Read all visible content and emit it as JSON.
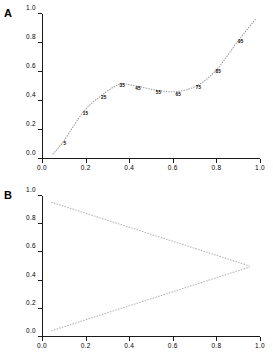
{
  "figure": {
    "panels": [
      {
        "label": "A",
        "name": "panel-a"
      },
      {
        "label": "B",
        "name": "panel-b"
      }
    ]
  },
  "axes": {
    "x_ticks": [
      "0.0",
      "0.2",
      "0.4",
      "0.6",
      "0.8",
      "1.0"
    ],
    "x_tick_values": [
      0.0,
      0.2,
      0.4,
      0.6,
      0.8,
      1.0
    ],
    "y_ticks": [
      "0.0",
      "0.2",
      "0.4",
      "0.6",
      "0.8",
      "1.0"
    ],
    "y_tick_values": [
      0.0,
      0.2,
      0.4,
      0.6,
      0.8,
      1.0
    ]
  },
  "chart_data": [
    {
      "type": "line",
      "panel": "A",
      "title": "",
      "xlabel": "",
      "ylabel": "",
      "xlim": [
        0.0,
        1.0
      ],
      "ylim": [
        0.0,
        1.0
      ],
      "grid": false,
      "legend": "none",
      "linestyle": "dotted",
      "color": "#9a9a9a",
      "x": [
        0.05,
        0.1,
        0.19,
        0.27,
        0.355,
        0.425,
        0.525,
        0.615,
        0.71,
        0.8,
        0.905,
        0.98
      ],
      "y": [
        0.035,
        0.125,
        0.325,
        0.435,
        0.515,
        0.505,
        0.475,
        0.465,
        0.505,
        0.615,
        0.825,
        0.965
      ],
      "annotations": [
        {
          "label": "5",
          "x": 0.105,
          "y": 0.113
        },
        {
          "label": "15",
          "x": 0.2,
          "y": 0.318
        },
        {
          "label": "25",
          "x": 0.283,
          "y": 0.43
        },
        {
          "label": "35",
          "x": 0.368,
          "y": 0.507
        },
        {
          "label": "45",
          "x": 0.44,
          "y": 0.492
        },
        {
          "label": "55",
          "x": 0.535,
          "y": 0.462
        },
        {
          "label": "65",
          "x": 0.625,
          "y": 0.45
        },
        {
          "label": "75",
          "x": 0.718,
          "y": 0.497
        },
        {
          "label": "85",
          "x": 0.808,
          "y": 0.607
        },
        {
          "label": "95",
          "x": 0.912,
          "y": 0.812
        }
      ]
    },
    {
      "type": "line",
      "panel": "B",
      "title": "",
      "xlabel": "",
      "ylabel": "",
      "xlim": [
        0.0,
        1.0
      ],
      "ylim": [
        0.0,
        1.0
      ],
      "grid": false,
      "legend": "none",
      "linestyle": "dotted",
      "color": "#b0b0b0",
      "series": [
        {
          "name": "upper-bound",
          "x": [
            0.045,
            0.95
          ],
          "y": [
            0.955,
            0.505
          ]
        },
        {
          "name": "lower-bound",
          "x": [
            0.045,
            0.95
          ],
          "y": [
            0.045,
            0.495
          ]
        }
      ],
      "convergence_point": {
        "x": 0.95,
        "y": 0.5
      }
    }
  ]
}
